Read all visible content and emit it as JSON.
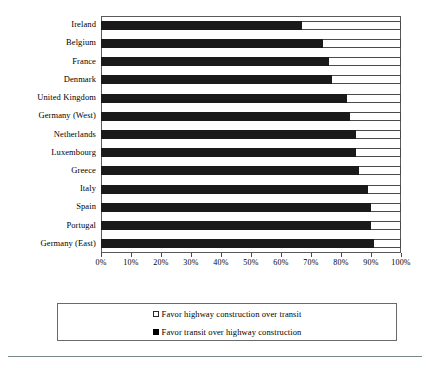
{
  "chart_data": {
    "type": "bar",
    "orientation": "horizontal",
    "stacked": true,
    "title": "",
    "xlabel": "",
    "ylabel": "",
    "xlim": [
      0,
      100
    ],
    "grid": false,
    "legend_position": "bottom",
    "categories": [
      "Ireland",
      "Belgium",
      "France",
      "Denmark",
      "United Kingdom",
      "Germany (West)",
      "Netherlands",
      "Luxembourg",
      "Greece",
      "Italy",
      "Spain",
      "Portugal",
      "Germany (East)"
    ],
    "xticks": [
      0,
      10,
      20,
      30,
      40,
      50,
      60,
      70,
      80,
      90,
      100
    ],
    "xticklabels": [
      "0%",
      "10%",
      "20%",
      "30%",
      "40%",
      "50%",
      "60%",
      "70%",
      "80%",
      "90%",
      "100%"
    ],
    "series": [
      {
        "name": "Favor transit over highway construction",
        "color": "#000000",
        "values": [
          67,
          74,
          76,
          77,
          82,
          83,
          85,
          85,
          86,
          89,
          90,
          90,
          91
        ]
      },
      {
        "name": "Favor highway construction over transit",
        "color": "#ffffff",
        "values": [
          33,
          26,
          24,
          23,
          18,
          17,
          15,
          15,
          14,
          11,
          10,
          10,
          9
        ]
      }
    ]
  },
  "legend": {
    "entries": [
      {
        "marker": "open-square-icon",
        "label": "Favor highway construction over transit"
      },
      {
        "marker": "filled-square-icon",
        "label": "Favor transit over highway construction"
      }
    ]
  }
}
